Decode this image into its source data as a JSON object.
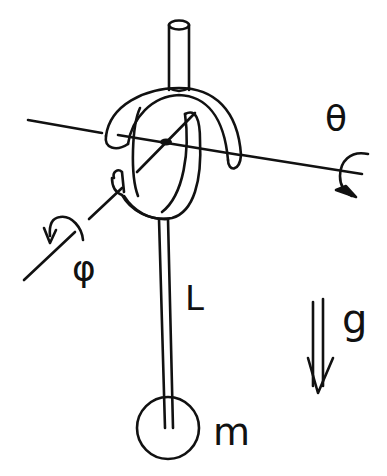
{
  "diagram": {
    "labels": {
      "theta": "θ",
      "phi": "φ",
      "length": "L",
      "gravity": "g",
      "mass": "m"
    },
    "colors": {
      "ink": "#111111",
      "background": "#ffffff"
    }
  }
}
